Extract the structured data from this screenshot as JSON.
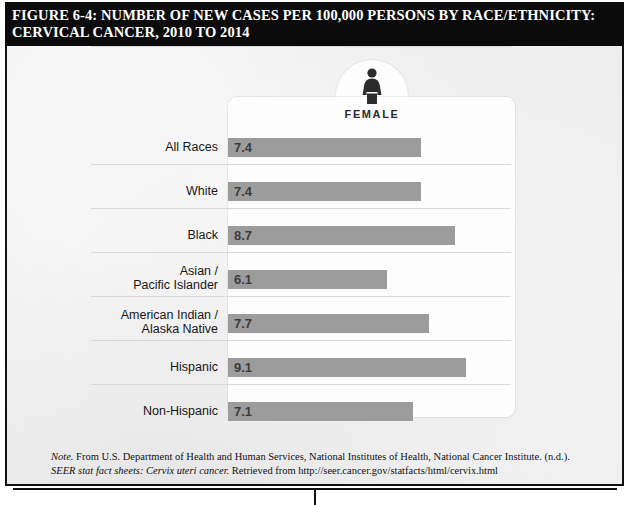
{
  "title": {
    "line1": "FIGURE 6-4: NUMBER OF NEW CASES PER 100,000 PERSONS BY RACE/ETHNICITY:",
    "line2": "CERVICAL CANCER, 2010 TO 2014"
  },
  "panel": {
    "gender_label": "FEMALE",
    "gender_icon": "female-figure-icon"
  },
  "footnote": {
    "note_prefix": "Note.",
    "text_part1": " From U.S. Department of Health and Human Services, National Institutes of Health, National Cancer Institute. (n.d.). ",
    "italic_title1": "SEER stat fact sheets:",
    "italic_title2": "Cervix uteri cancer.",
    "text_part2": " Retrieved from http://seer.cancer.gov/statfacts/html/cervix.html"
  },
  "colors": {
    "bar": "#9c9c9c",
    "panel": "#fdfdfd",
    "background": "#ececed",
    "title_bar": "#0b0b0b",
    "separator": "#d9d9da"
  },
  "chart_data": {
    "type": "bar",
    "orientation": "horizontal",
    "title": "FIGURE 6-4: NUMBER OF NEW CASES PER 100,000 PERSONS BY RACE/ETHNICITY: CERVICAL CANCER, 2010 TO 2014",
    "subtitle": "FEMALE",
    "xlabel": "New cases per 100,000 persons",
    "ylabel": "",
    "xlim": [
      0,
      11
    ],
    "grid": false,
    "legend": "none",
    "value_labels": true,
    "categories": [
      "All Races",
      "White",
      "Black",
      "Asian /\nPacific Islander",
      "American Indian /\nAlaska Native",
      "Hispanic",
      "Non-Hispanic"
    ],
    "values": [
      7.4,
      7.4,
      8.7,
      6.1,
      7.7,
      9.1,
      7.1
    ],
    "rows": [
      {
        "label_line1": "All Races",
        "label_line2": "",
        "value": 7.4,
        "value_text": "7.4"
      },
      {
        "label_line1": "White",
        "label_line2": "",
        "value": 7.4,
        "value_text": "7.4"
      },
      {
        "label_line1": "Black",
        "label_line2": "",
        "value": 8.7,
        "value_text": "8.7"
      },
      {
        "label_line1": "Asian /",
        "label_line2": "Pacific Islander",
        "value": 6.1,
        "value_text": "6.1"
      },
      {
        "label_line1": "American Indian /",
        "label_line2": "Alaska Native",
        "value": 7.7,
        "value_text": "7.7"
      },
      {
        "label_line1": "Hispanic",
        "label_line2": "",
        "value": 9.1,
        "value_text": "9.1"
      },
      {
        "label_line1": "Non-Hispanic",
        "label_line2": "",
        "value": 7.1,
        "value_text": "7.1"
      }
    ]
  }
}
